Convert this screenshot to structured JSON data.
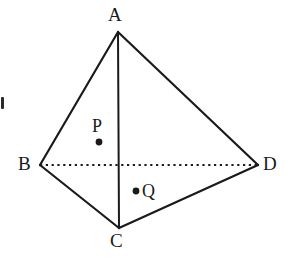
{
  "figure": {
    "type": "tetrahedron-diagram",
    "background_color": "#ffffff",
    "stroke_color": "#1a1a1a",
    "hidden_edge_color": "#1a1a1a",
    "label_color": "#1a1a1a",
    "canvas": {
      "width": 289,
      "height": 267
    }
  },
  "vertices": [
    {
      "id": "A",
      "label": "A",
      "x": 118,
      "y": 32,
      "label_x": 108,
      "label_y": 5,
      "position": "apex-top"
    },
    {
      "id": "B",
      "label": "B",
      "x": 40,
      "y": 165,
      "label_x": 18,
      "label_y": 154,
      "position": "left"
    },
    {
      "id": "C",
      "label": "C",
      "x": 119,
      "y": 228,
      "label_x": 110,
      "label_y": 231,
      "position": "bottom"
    },
    {
      "id": "D",
      "label": "D",
      "x": 258,
      "y": 165,
      "label_x": 263,
      "label_y": 154,
      "position": "right"
    }
  ],
  "edges": [
    {
      "id": "AB",
      "from": "A",
      "to": "B",
      "style": "solid",
      "width": 2.2
    },
    {
      "id": "AC",
      "from": "A",
      "to": "C",
      "style": "solid",
      "width": 2.0
    },
    {
      "id": "AD",
      "from": "A",
      "to": "D",
      "style": "solid",
      "width": 2.2
    },
    {
      "id": "BC",
      "from": "B",
      "to": "C",
      "style": "solid",
      "width": 2.2
    },
    {
      "id": "CD",
      "from": "C",
      "to": "D",
      "style": "solid",
      "width": 2.2
    },
    {
      "id": "BD",
      "from": "B",
      "to": "D",
      "style": "dotted",
      "width": 2.0,
      "hidden": true
    }
  ],
  "points": [
    {
      "id": "P",
      "label": "P",
      "x": 99,
      "y": 142,
      "radius": 3.4,
      "label_x": 92,
      "label_y": 117,
      "label_position": "above"
    },
    {
      "id": "Q",
      "label": "Q",
      "x": 136,
      "y": 191,
      "radius": 3.4,
      "label_x": 142,
      "label_y": 182,
      "label_position": "right"
    }
  ],
  "artifacts": [
    {
      "id": "scan-mark",
      "x": 1,
      "y": 97,
      "width": 3,
      "height": 12,
      "color": "#2b2b2b"
    }
  ]
}
